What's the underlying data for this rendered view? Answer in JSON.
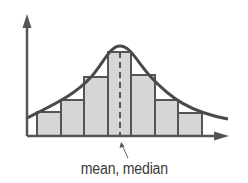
{
  "diagram": {
    "annotation_label": "mean, median",
    "colors": {
      "stroke": "#555555",
      "bar_fill": "#d6d6d6",
      "curve": "#4a4a4a",
      "label": "#3a3a3a"
    },
    "axes": {
      "origin": [
        27,
        136
      ],
      "y_axis_top": 15,
      "x_axis_right": 228
    },
    "bars": [
      {
        "x0": 37,
        "x1": 61,
        "top": 112
      },
      {
        "x0": 61,
        "x1": 84,
        "top": 100
      },
      {
        "x0": 84,
        "x1": 108,
        "top": 77
      },
      {
        "x0": 108,
        "x1": 131,
        "top": 52
      },
      {
        "x0": 131,
        "x1": 155,
        "top": 75
      },
      {
        "x0": 155,
        "x1": 178,
        "top": 100
      },
      {
        "x0": 178,
        "x1": 202,
        "top": 113
      }
    ],
    "mean_line_x": 120,
    "arrow_pointer": {
      "from": [
        128,
        160
      ],
      "to": [
        121,
        143
      ]
    }
  }
}
